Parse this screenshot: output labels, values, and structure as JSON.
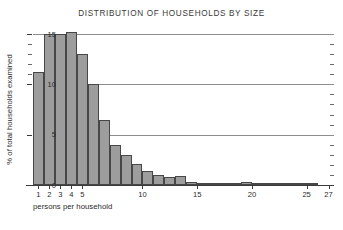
{
  "chart_data": {
    "type": "bar",
    "title": "DISTRIBUTION OF HOUSEHOLDS BY SIZE",
    "xlabel": "persons per household",
    "ylabel": "% of total households examined",
    "xlim": [
      0,
      27.5
    ],
    "ylim": [
      0,
      15.6
    ],
    "grid": "horizontal-major",
    "legend": "none",
    "x_ticks_labeled": [
      "1",
      "2",
      "3",
      "4",
      "5",
      "10",
      "15",
      "20",
      "25",
      "27"
    ],
    "y_ticks_labeled": [
      "0",
      "5",
      "10",
      "15"
    ],
    "y_tick_values": [
      0,
      5,
      10,
      15
    ],
    "y_minor_step": 1,
    "categories": [
      1,
      2,
      3,
      4,
      5,
      6,
      7,
      8,
      9,
      10,
      11,
      12,
      13,
      14,
      15,
      16,
      17,
      18,
      19,
      20,
      21,
      22,
      23,
      24,
      25,
      26
    ],
    "values": [
      11.2,
      15.0,
      15.0,
      15.2,
      13.0,
      10.0,
      6.5,
      4.0,
      3.0,
      2.1,
      1.4,
      1.0,
      0.8,
      0.85,
      0.25,
      0.2,
      0.15,
      0.2,
      0.1,
      0.25,
      0.1,
      0.08,
      0.05,
      0.05,
      0.05,
      0.1
    ],
    "bar_fill_color": "#9d9d9d",
    "bar_edge_color": "#474747",
    "grid_color": "#8d8d8d",
    "axis_color": "#3a3a3a",
    "background_color": "#ffffff"
  }
}
